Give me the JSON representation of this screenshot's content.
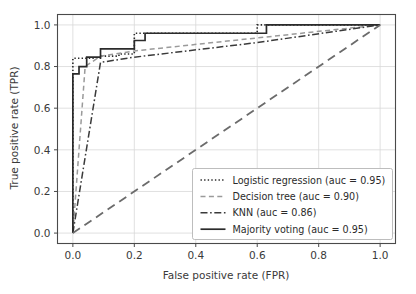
{
  "chart_data": {
    "type": "line",
    "title": "",
    "xlabel": "False positive rate (FPR)",
    "ylabel": "True positive rate (TPR)",
    "xlim": [
      -0.05,
      1.05
    ],
    "ylim": [
      -0.05,
      1.05
    ],
    "xticks": [
      "0.0",
      "0.2",
      "0.4",
      "0.6",
      "0.8",
      "1.0"
    ],
    "yticks": [
      "0.0",
      "0.2",
      "0.4",
      "0.6",
      "0.8",
      "1.0"
    ],
    "xtick_values": [
      0.0,
      0.2,
      0.4,
      0.6,
      0.8,
      1.0
    ],
    "ytick_values": [
      0.0,
      0.2,
      0.4,
      0.6,
      0.8,
      1.0
    ],
    "grid": true,
    "legend_position": "lower right",
    "series": [
      {
        "name": "Logistic regression",
        "auc": "0.95",
        "legend_label": "Logistic regression (auc = 0.95)",
        "linestyle": "dotted",
        "color": "#2b2b2b",
        "linewidth": 1.6,
        "x": [
          0.0,
          0.0,
          0.02,
          0.02,
          0.09,
          0.09,
          0.15,
          0.15,
          0.2,
          0.2,
          0.6,
          0.6,
          1.0
        ],
        "y": [
          0.0,
          0.84,
          0.84,
          0.84,
          0.84,
          0.85,
          0.85,
          0.86,
          0.86,
          0.96,
          0.96,
          1.0,
          1.0
        ]
      },
      {
        "name": "Decision tree",
        "auc": "0.90",
        "legend_label": "Decision tree (auc = 0.90)",
        "linestyle": "dashed",
        "color": "#9a9a9a",
        "linewidth": 1.5,
        "x": [
          0.0,
          0.04,
          0.09,
          0.2,
          1.0
        ],
        "y": [
          0.0,
          0.8,
          0.85,
          0.875,
          1.0
        ]
      },
      {
        "name": "KNN",
        "auc": "0.86",
        "legend_label": "KNN (auc = 0.86)",
        "linestyle": "dashdot",
        "color": "#3a3a3a",
        "linewidth": 1.5,
        "x": [
          0.0,
          0.09,
          0.2,
          0.6,
          1.0
        ],
        "y": [
          0.0,
          0.82,
          0.845,
          0.915,
          1.0
        ]
      },
      {
        "name": "Majority voting",
        "auc": "0.95",
        "legend_label": "Majority voting (auc = 0.95)",
        "linestyle": "solid",
        "color": "#2b2b2b",
        "linewidth": 1.7,
        "x": [
          0.0,
          0.0,
          0.02,
          0.02,
          0.045,
          0.045,
          0.09,
          0.09,
          0.2,
          0.2,
          0.235,
          0.235,
          0.63,
          0.63,
          1.0
        ],
        "y": [
          0.0,
          0.765,
          0.765,
          0.8,
          0.8,
          0.845,
          0.845,
          0.885,
          0.885,
          0.925,
          0.925,
          0.96,
          0.96,
          1.0,
          1.0
        ]
      },
      {
        "name": "Chance",
        "auc": "",
        "legend_label": "",
        "linestyle": "longdash",
        "color": "#6b6b6b",
        "linewidth": 1.8,
        "in_legend": false,
        "x": [
          0.0,
          1.0
        ],
        "y": [
          0.0,
          1.0
        ]
      }
    ]
  },
  "legend": {
    "entries": [
      {
        "label": "Logistic regression (auc = 0.95)"
      },
      {
        "label": "Decision tree (auc = 0.90)"
      },
      {
        "label": "KNN (auc = 0.86)"
      },
      {
        "label": "Majority voting (auc = 0.95)"
      }
    ]
  },
  "axes": {
    "xlabel": "False positive rate (FPR)",
    "ylabel": "True positive rate (TPR)",
    "xtick_labels": [
      "0.0",
      "0.2",
      "0.4",
      "0.6",
      "0.8",
      "1.0"
    ],
    "ytick_labels": [
      "0.0",
      "0.2",
      "0.4",
      "0.6",
      "0.8",
      "1.0"
    ]
  },
  "colors": {
    "background": "#ffffff",
    "grid": "#d8d8d8",
    "spine": "#4a4a4a",
    "text": "#3a3a3a",
    "series_dark": "#2b2b2b",
    "series_light": "#9a9a9a",
    "chance": "#6b6b6b"
  }
}
